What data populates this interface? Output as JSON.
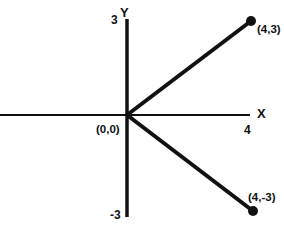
{
  "diagram": {
    "type": "coordinate-plane",
    "colors": {
      "stroke": "#111111",
      "background": "#ffffff"
    },
    "axes": {
      "x": {
        "label": "X",
        "tick_label": "4"
      },
      "y": {
        "label": "Y",
        "top_tick_label": "3",
        "bottom_tick_label": "-3"
      }
    },
    "origin": {
      "label": "(0,0)"
    },
    "points": [
      {
        "label": "(4,3)",
        "x": 4,
        "y": 3
      },
      {
        "label": "(4,-3)",
        "x": 4,
        "y": -3
      }
    ],
    "segments": [
      {
        "from": "(0,0)",
        "to": "(4,3)"
      },
      {
        "from": "(0,0)",
        "to": "(4,-3)"
      }
    ]
  }
}
